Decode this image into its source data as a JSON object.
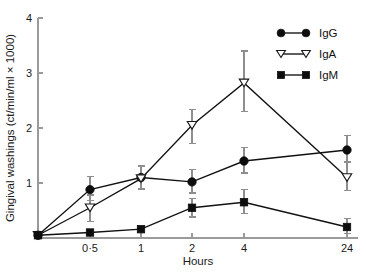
{
  "chart_data": {
    "type": "line",
    "title": "",
    "xlabel": "Hours",
    "ylabel": "Gingival washings (ct/min/ml × 1000)",
    "categories": [
      "0",
      "0·5",
      "1",
      "2",
      "4",
      "24"
    ],
    "x_tick_labels": [
      "0·5",
      "1",
      "2",
      "4",
      "24"
    ],
    "y_tick_labels": [
      "1",
      "2",
      "3",
      "4"
    ],
    "y_ticks": [
      1,
      2,
      3,
      4
    ],
    "ylim": [
      0,
      4
    ],
    "grid": false,
    "legend_position": "top-right",
    "series": [
      {
        "name": "IgG",
        "marker": "filled-circle",
        "values": [
          0.05,
          0.88,
          1.1,
          1.02,
          1.4,
          1.6
        ],
        "err_low": [
          0.05,
          0.68,
          0.9,
          0.82,
          1.18,
          1.38
        ],
        "err_high": [
          0.05,
          1.12,
          1.32,
          1.24,
          1.65,
          1.86
        ]
      },
      {
        "name": "IgA",
        "marker": "open-triangle-down",
        "values": [
          0.05,
          0.55,
          1.08,
          2.05,
          2.82,
          1.1
        ],
        "err_low": [
          0.05,
          0.3,
          0.88,
          1.72,
          2.3,
          0.86
        ],
        "err_high": [
          0.05,
          0.78,
          1.3,
          2.34,
          3.4,
          1.38
        ]
      },
      {
        "name": "IgM",
        "marker": "filled-square",
        "values": [
          0.05,
          0.1,
          0.16,
          0.55,
          0.65,
          0.2
        ],
        "err_low": [
          0.05,
          0.1,
          0.16,
          0.38,
          0.44,
          0.08
        ],
        "err_high": [
          0.05,
          0.1,
          0.16,
          0.72,
          0.88,
          0.36
        ]
      }
    ],
    "legend": [
      {
        "label": "IgG",
        "marker": "filled-circle"
      },
      {
        "label": "IgA",
        "marker": "open-triangle-down"
      },
      {
        "label": "IgM",
        "marker": "filled-square"
      }
    ],
    "colors": {
      "line": "#111111",
      "axis": "#9a9a9a",
      "error_bar": "#8e8e8e",
      "text": "#1a1a1a"
    }
  }
}
